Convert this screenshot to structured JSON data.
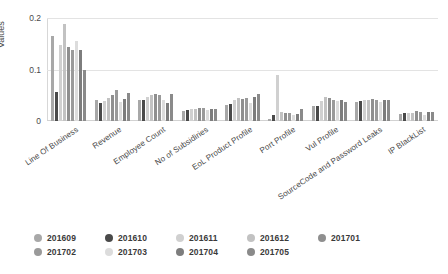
{
  "chart": {
    "type": "bar",
    "title": "",
    "ylabel": "Values",
    "xlabel": ""
  },
  "axis": {
    "y_ticks": [
      "0",
      "0.1",
      "0.2"
    ],
    "y_values": [
      0,
      0.1,
      0.2
    ],
    "ylim": [
      0,
      0.2
    ]
  },
  "legend": {
    "position": "bottom",
    "items": [
      {
        "label": "201609",
        "color": "#a8a8a8"
      },
      {
        "label": "201610",
        "color": "#4a4a4a"
      },
      {
        "label": "201611",
        "color": "#d0d0d0"
      },
      {
        "label": "201612",
        "color": "#c2c2c2"
      },
      {
        "label": "201701",
        "color": "#8f8f8f"
      },
      {
        "label": "201702",
        "color": "#9a9a9a"
      },
      {
        "label": "201703",
        "color": "#dcdcdc"
      },
      {
        "label": "201704",
        "color": "#7d7d7d"
      },
      {
        "label": "201705",
        "color": "#8a8a8a"
      }
    ]
  },
  "chart_data": {
    "type": "bar",
    "title": "",
    "xlabel": "",
    "ylabel": "Values",
    "ylim": [
      0,
      0.2
    ],
    "grid": true,
    "legend_position": "bottom",
    "categories": [
      "Line Of Business",
      "Revenue",
      "Employee Count",
      "No of Subsidiries",
      "EoL Product Profile",
      "Port Profile",
      "Vul Profile",
      "SourceCode and Password Leaks",
      "IP BlackList"
    ],
    "series": [
      {
        "name": "201609",
        "color": "#a8a8a8",
        "values": [
          0.165,
          0.041,
          0.04,
          0.019,
          0.031,
          0.004,
          0.03,
          0.036,
          0.013
        ]
      },
      {
        "name": "201610",
        "color": "#4a4a4a",
        "values": [
          0.057,
          0.035,
          0.041,
          0.021,
          0.034,
          0.012,
          0.03,
          0.038,
          0.015
        ]
      },
      {
        "name": "201611",
        "color": "#d0d0d0",
        "values": [
          0.148,
          0.038,
          0.046,
          0.023,
          0.04,
          0.09,
          0.038,
          0.04,
          0.016
        ]
      },
      {
        "name": "201612",
        "color": "#c2c2c2",
        "values": [
          0.188,
          0.044,
          0.05,
          0.024,
          0.045,
          0.018,
          0.046,
          0.041,
          0.016
        ]
      },
      {
        "name": "201701",
        "color": "#8f8f8f",
        "values": [
          0.143,
          0.05,
          0.052,
          0.025,
          0.042,
          0.015,
          0.044,
          0.042,
          0.019
        ]
      },
      {
        "name": "201702",
        "color": "#9a9a9a",
        "values": [
          0.137,
          0.06,
          0.051,
          0.025,
          0.044,
          0.016,
          0.04,
          0.04,
          0.018
        ]
      },
      {
        "name": "201703",
        "color": "#dcdcdc",
        "values": [
          0.155,
          0.036,
          0.041,
          0.022,
          0.035,
          0.012,
          0.038,
          0.036,
          0.012
        ]
      },
      {
        "name": "201704",
        "color": "#7d7d7d",
        "values": [
          0.138,
          0.042,
          0.035,
          0.024,
          0.046,
          0.013,
          0.041,
          0.04,
          0.017
        ]
      },
      {
        "name": "201705",
        "color": "#8a8a8a",
        "values": [
          0.1,
          0.055,
          0.052,
          0.024,
          0.052,
          0.024,
          0.036,
          0.041,
          0.018
        ]
      }
    ]
  }
}
